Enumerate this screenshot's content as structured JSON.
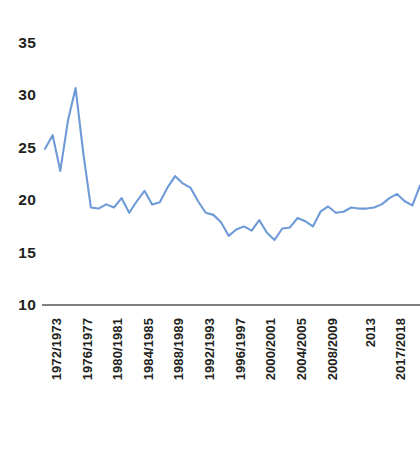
{
  "chart": {
    "title": "",
    "line_color": "#6E9BD7",
    "axis_color": "#808080",
    "text_color": "#231f20"
  },
  "chart_data": {
    "type": "line",
    "title": "",
    "subtitle": "",
    "xlabel": "",
    "ylabel": "",
    "ylim": [
      10,
      35
    ],
    "yticks": [
      35,
      30,
      25,
      20,
      15,
      10
    ],
    "grid": false,
    "legend": null,
    "xticks_shown": [
      "1972/1973",
      "1976/1977",
      "1980/1981",
      "1984/1985",
      "1988/1989",
      "1992/1993",
      "1996/1997",
      "2000/2001",
      "2004/2005",
      "2008/2009",
      "2013",
      "2017/2018",
      "EXERCICE 2021-22"
    ],
    "x": [
      "1972/1973",
      "1973/1974",
      "1974/1975",
      "1975/1976",
      "1976/1977",
      "1977/1978",
      "1978/1979",
      "1979/1980",
      "1980/1981",
      "1981/1982",
      "1982/1983",
      "1983/1984",
      "1984/1985",
      "1985/1986",
      "1986/1987",
      "1987/1988",
      "1988/1989",
      "1989/1990",
      "1990/1991",
      "1991/1992",
      "1992/1993",
      "1993/1994",
      "1994/1995",
      "1995/1996",
      "1996/1997",
      "1997/1998",
      "1998/1999",
      "1999/2000",
      "2000/2001",
      "2001/2002",
      "2002/2003",
      "2003/2004",
      "2004/2005",
      "2005/2006",
      "2006/2007",
      "2007/2008",
      "2008/2009",
      "2009/2010",
      "2010/2011",
      "2011/2012",
      "2012/2013",
      "2013",
      "2014/2015",
      "2015/2016",
      "2016/2017",
      "2017/2018",
      "2018/2019",
      "2019/2020",
      "2020/2021",
      "EXERCICE 2021-22"
    ],
    "values": [
      24.9,
      26.2,
      22.8,
      27.6,
      30.7,
      24.5,
      19.3,
      19.2,
      19.6,
      19.3,
      20.2,
      18.8,
      19.9,
      20.9,
      19.6,
      19.8,
      21.2,
      22.3,
      21.6,
      21.2,
      19.9,
      18.8,
      18.6,
      17.9,
      16.6,
      17.2,
      17.5,
      17.1,
      18.1,
      16.9,
      16.2,
      17.3,
      17.4,
      18.3,
      18.0,
      17.5,
      18.9,
      19.4,
      18.8,
      18.9,
      19.3,
      19.2,
      19.2,
      19.3,
      19.6,
      20.2,
      20.6,
      19.9,
      19.5,
      21.4
    ],
    "series": [
      {
        "name": "series-1",
        "color": "#6E9BD7",
        "values": [
          24.9,
          26.2,
          22.8,
          27.6,
          30.7,
          24.5,
          19.3,
          19.2,
          19.6,
          19.3,
          20.2,
          18.8,
          19.9,
          20.9,
          19.6,
          19.8,
          21.2,
          22.3,
          21.6,
          21.2,
          19.9,
          18.8,
          18.6,
          17.9,
          16.6,
          17.2,
          17.5,
          17.1,
          18.1,
          16.9,
          16.2,
          17.3,
          17.4,
          18.3,
          18.0,
          17.5,
          18.9,
          19.4,
          18.8,
          18.9,
          19.3,
          19.2,
          19.2,
          19.3,
          19.6,
          20.2,
          20.6,
          19.9,
          19.5,
          21.4
        ]
      }
    ]
  }
}
